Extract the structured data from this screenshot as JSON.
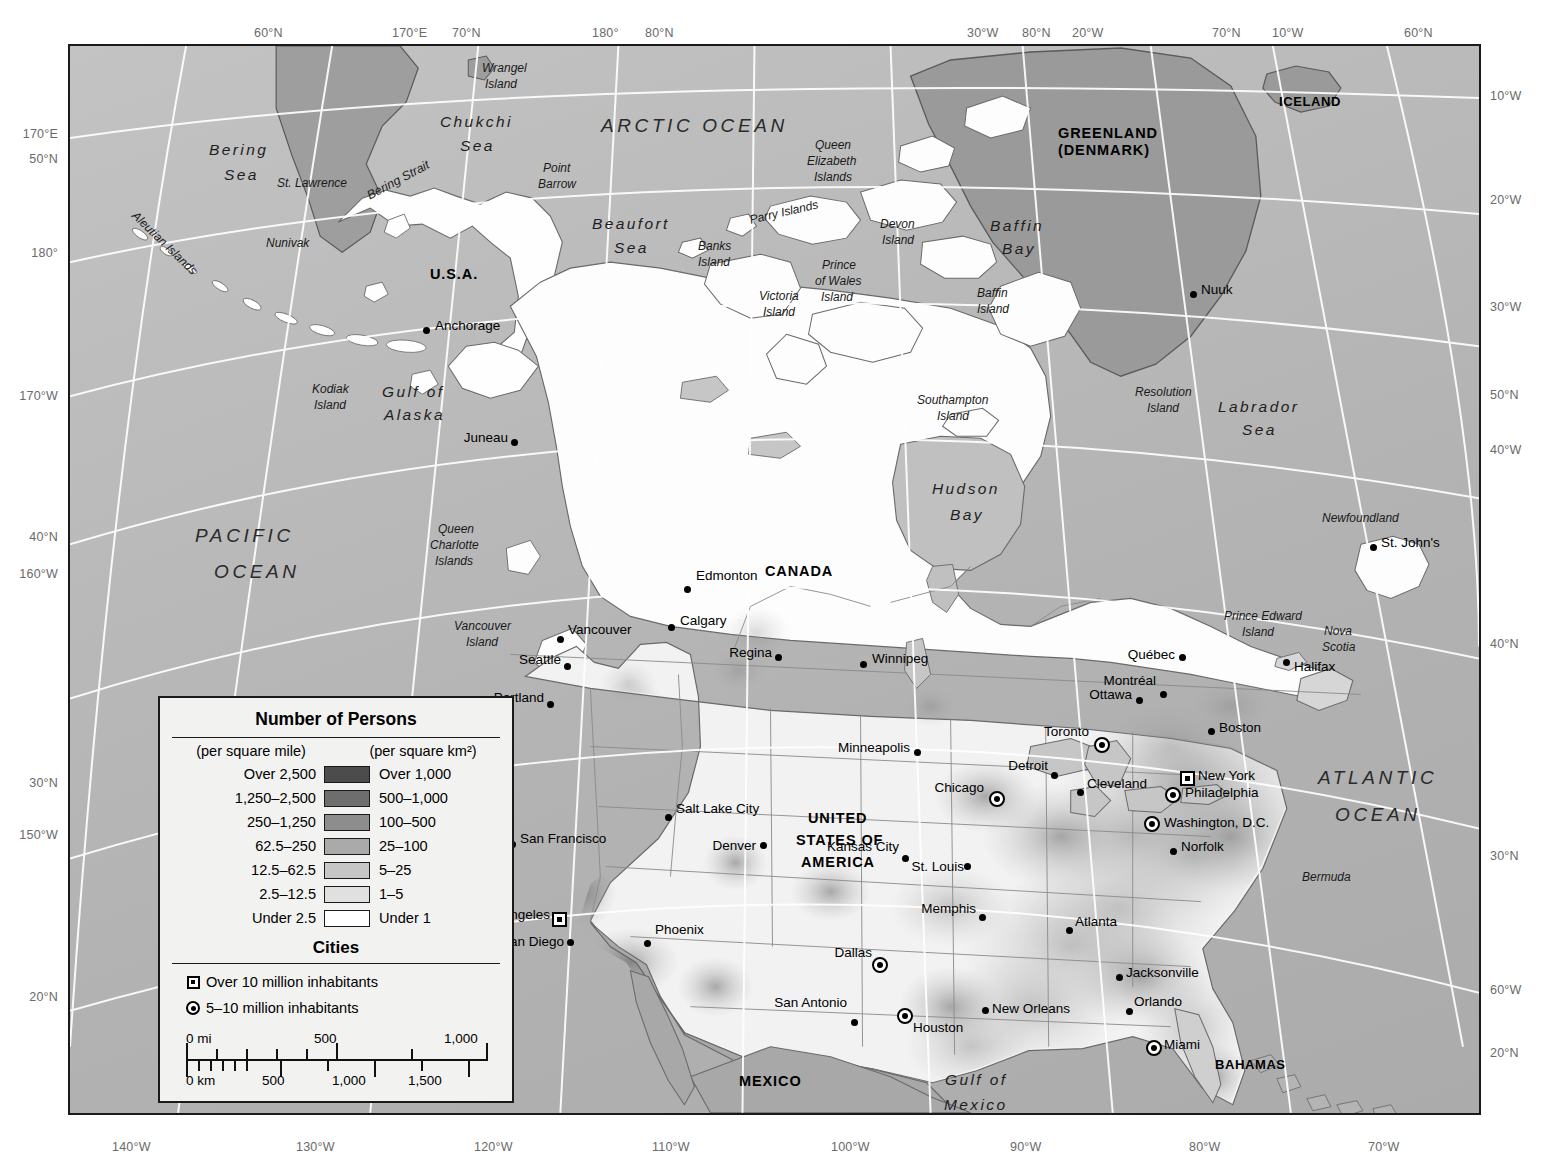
{
  "map": {
    "title": "Population Density of North America",
    "ocean_color": "#bcbcbc",
    "frame_color": "#1a1a1a",
    "graticule_color": "#ffffff"
  },
  "edge_labels": {
    "top": [
      {
        "text": "60°N",
        "x": 254
      },
      {
        "text": "170°E",
        "x": 392
      },
      {
        "text": "70°N",
        "x": 452
      },
      {
        "text": "180°",
        "x": 592
      },
      {
        "text": "80°N",
        "x": 645
      },
      {
        "text": "30°W",
        "x": 967
      },
      {
        "text": "80°N",
        "x": 1022
      },
      {
        "text": "20°W",
        "x": 1072
      },
      {
        "text": "70°N",
        "x": 1212
      },
      {
        "text": "10°W",
        "x": 1272
      },
      {
        "text": "60°N",
        "x": 1404
      }
    ],
    "left": [
      {
        "text": "170°E",
        "y": 127
      },
      {
        "text": "50°N",
        "y": 152
      },
      {
        "text": "180°",
        "y": 246
      },
      {
        "text": "170°W",
        "y": 389
      },
      {
        "text": "40°N",
        "y": 530
      },
      {
        "text": "160°W",
        "y": 567
      },
      {
        "text": "30°N",
        "y": 776
      },
      {
        "text": "150°W",
        "y": 828
      },
      {
        "text": "20°N",
        "y": 990
      }
    ],
    "right": [
      {
        "text": "10°W",
        "y": 89
      },
      {
        "text": "20°W",
        "y": 193
      },
      {
        "text": "30°W",
        "y": 300
      },
      {
        "text": "50°N",
        "y": 388
      },
      {
        "text": "40°W",
        "y": 443
      },
      {
        "text": "40°N",
        "y": 637
      },
      {
        "text": "30°N",
        "y": 849
      },
      {
        "text": "60°W",
        "y": 983
      },
      {
        "text": "20°N",
        "y": 1046
      }
    ],
    "bottom": [
      {
        "text": "140°W",
        "x": 112
      },
      {
        "text": "130°W",
        "x": 296
      },
      {
        "text": "120°W",
        "x": 474
      },
      {
        "text": "110°W",
        "x": 652
      },
      {
        "text": "100°W",
        "x": 831
      },
      {
        "text": "90°W",
        "x": 1010
      },
      {
        "text": "80°W",
        "x": 1189
      },
      {
        "text": "70°W",
        "x": 1368
      }
    ]
  },
  "legend": {
    "title": "Number of Persons",
    "head_left": "(per square mile)",
    "head_right": "(per square km²)",
    "rows": [
      {
        "mile": "Over 2,500",
        "km": "Over 1,000",
        "color": "#4c4c4c"
      },
      {
        "mile": "1,250–2,500",
        "km": "500–1,000",
        "color": "#6e6e6e"
      },
      {
        "mile": "250–1,250",
        "km": "100–500",
        "color": "#8d8d8d"
      },
      {
        "mile": "62.5–250",
        "km": "25–100",
        "color": "#aaaaaa"
      },
      {
        "mile": "12.5–62.5",
        "km": "5–25",
        "color": "#c6c6c6"
      },
      {
        "mile": "2.5–12.5",
        "km": "1–5",
        "color": "#e0e0e0"
      },
      {
        "mile": "Under 2.5",
        "km": "Under 1",
        "color": "#ffffff"
      }
    ],
    "cities_title": "Cities",
    "city_classes": [
      {
        "symbol": "square-in-square",
        "label": "Over 10 million inhabitants"
      },
      {
        "symbol": "circle-in-circle",
        "label": "5–10 million inhabitants"
      }
    ],
    "scale": {
      "miles_unit": "0 mi",
      "miles_mid": "500",
      "miles_end": "1,000",
      "km_unit": "0 km",
      "km_ticks": [
        "500",
        "1,000",
        "1,500"
      ]
    }
  },
  "countries": [
    {
      "name": "RUSSIA",
      "x": 291,
      "y": 32,
      "cls": "country"
    },
    {
      "name": "U.S.A.",
      "x": 428,
      "y": 265,
      "cls": "country"
    },
    {
      "name": "CANADA",
      "x": 763,
      "y": 562,
      "cls": "country"
    },
    {
      "name": "GREENLAND",
      "x": 1056,
      "y": 124,
      "cls": "country"
    },
    {
      "name": "(DENMARK)",
      "x": 1056,
      "y": 141,
      "cls": "country"
    },
    {
      "name": "ICELAND",
      "x": 1277,
      "y": 93,
      "cls": "country small"
    },
    {
      "name": "UNITED",
      "x": 806,
      "y": 809,
      "cls": "country"
    },
    {
      "name": "STATES OF",
      "x": 794,
      "y": 831,
      "cls": "country"
    },
    {
      "name": "AMERICA",
      "x": 799,
      "y": 853,
      "cls": "country"
    },
    {
      "name": "MEXICO",
      "x": 737,
      "y": 1072,
      "cls": "country"
    },
    {
      "name": "BAHAMAS",
      "x": 1213,
      "y": 1056,
      "cls": "country small"
    },
    {
      "name": "CUBA",
      "x": 1167,
      "y": 1112,
      "cls": "country small"
    }
  ],
  "oceans": [
    {
      "name": "ARCTIC OCEAN",
      "x": 599,
      "y": 114,
      "cls": "ocean"
    },
    {
      "name": "PACIFIC",
      "x": 193,
      "y": 524,
      "cls": "ocean"
    },
    {
      "name": "OCEAN",
      "x": 212,
      "y": 560,
      "cls": "ocean"
    },
    {
      "name": "ATLANTIC",
      "x": 1316,
      "y": 766,
      "cls": "ocean"
    },
    {
      "name": "OCEAN",
      "x": 1333,
      "y": 803,
      "cls": "ocean"
    }
  ],
  "seas": [
    {
      "name": "Bering",
      "x": 207,
      "y": 140,
      "cls": "sea"
    },
    {
      "name": "Sea",
      "x": 222,
      "y": 165,
      "cls": "sea"
    },
    {
      "name": "Chukchi",
      "x": 438,
      "y": 112,
      "cls": "sea"
    },
    {
      "name": "Sea",
      "x": 458,
      "y": 136,
      "cls": "sea"
    },
    {
      "name": "Beaufort",
      "x": 590,
      "y": 214,
      "cls": "sea"
    },
    {
      "name": "Sea",
      "x": 612,
      "y": 238,
      "cls": "sea"
    },
    {
      "name": "Baffin",
      "x": 988,
      "y": 216,
      "cls": "sea"
    },
    {
      "name": "Bay",
      "x": 1000,
      "y": 239,
      "cls": "sea"
    },
    {
      "name": "Labrador",
      "x": 1216,
      "y": 397,
      "cls": "sea"
    },
    {
      "name": "Sea",
      "x": 1240,
      "y": 420,
      "cls": "sea"
    },
    {
      "name": "Hudson",
      "x": 930,
      "y": 479,
      "cls": "sea"
    },
    {
      "name": "Bay",
      "x": 948,
      "y": 505,
      "cls": "sea"
    }
  ],
  "water_features": [
    {
      "name": "Bering Strait",
      "x": 362,
      "y": 172,
      "cls": "water",
      "rot": -28
    },
    {
      "name": "Gulf of",
      "x": 380,
      "y": 382,
      "cls": "sea"
    },
    {
      "name": "Alaska",
      "x": 382,
      "y": 405,
      "cls": "sea"
    },
    {
      "name": "Gulf of",
      "x": 943,
      "y": 1070,
      "cls": "sea"
    },
    {
      "name": "Mexico",
      "x": 942,
      "y": 1095,
      "cls": "sea"
    }
  ],
  "islands": [
    {
      "name": "Wrangel",
      "x": 480,
      "y": 60
    },
    {
      "name": "Island",
      "x": 483,
      "y": 76
    },
    {
      "name": "St. Lawrence",
      "x": 275,
      "y": 175
    },
    {
      "name": "Nunivak",
      "x": 264,
      "y": 235
    },
    {
      "name": "Aleutian Islands",
      "x": 120,
      "y": 235,
      "rot": 44
    },
    {
      "name": "Kodiak",
      "x": 310,
      "y": 381
    },
    {
      "name": "Island",
      "x": 312,
      "y": 397
    },
    {
      "name": "Point",
      "x": 541,
      "y": 160
    },
    {
      "name": "Barrow",
      "x": 536,
      "y": 176
    },
    {
      "name": "Queen",
      "x": 813,
      "y": 137
    },
    {
      "name": "Elizabeth",
      "x": 805,
      "y": 153
    },
    {
      "name": "Islands",
      "x": 812,
      "y": 169
    },
    {
      "name": "Parry Islands",
      "x": 747,
      "y": 204,
      "rot": -13
    },
    {
      "name": "Devon",
      "x": 878,
      "y": 216
    },
    {
      "name": "Island",
      "x": 880,
      "y": 232
    },
    {
      "name": "Banks",
      "x": 696,
      "y": 238
    },
    {
      "name": "Island",
      "x": 696,
      "y": 254
    },
    {
      "name": "Prince",
      "x": 820,
      "y": 257
    },
    {
      "name": "of Wales",
      "x": 813,
      "y": 273
    },
    {
      "name": "Island",
      "x": 819,
      "y": 289
    },
    {
      "name": "Victoria",
      "x": 757,
      "y": 288
    },
    {
      "name": "Island",
      "x": 761,
      "y": 304
    },
    {
      "name": "Baffin",
      "x": 975,
      "y": 285
    },
    {
      "name": "Island",
      "x": 975,
      "y": 301
    },
    {
      "name": "Southampton",
      "x": 915,
      "y": 392
    },
    {
      "name": "Island",
      "x": 935,
      "y": 408
    },
    {
      "name": "Resolution",
      "x": 1133,
      "y": 384
    },
    {
      "name": "Island",
      "x": 1145,
      "y": 400
    },
    {
      "name": "Queen",
      "x": 436,
      "y": 521
    },
    {
      "name": "Charlotte",
      "x": 428,
      "y": 537
    },
    {
      "name": "Islands",
      "x": 433,
      "y": 553
    },
    {
      "name": "Vancouver",
      "x": 452,
      "y": 618
    },
    {
      "name": "Island",
      "x": 464,
      "y": 634
    },
    {
      "name": "Newfoundland",
      "x": 1320,
      "y": 510
    },
    {
      "name": "Prince Edward",
      "x": 1222,
      "y": 608
    },
    {
      "name": "Island",
      "x": 1240,
      "y": 624
    },
    {
      "name": "Nova",
      "x": 1322,
      "y": 623
    },
    {
      "name": "Scotia",
      "x": 1320,
      "y": 639
    },
    {
      "name": "Bermuda",
      "x": 1300,
      "y": 869
    }
  ],
  "cities": [
    {
      "name": "Anchorage",
      "x": 424,
      "y": 328,
      "sym": "dot",
      "lx": 433,
      "ly": 325,
      "anchor": "left"
    },
    {
      "name": "Juneau",
      "x": 512,
      "y": 440,
      "sym": "dot",
      "lx": 506,
      "ly": 437,
      "anchor": "right"
    },
    {
      "name": "Nuuk",
      "x": 1191,
      "y": 292,
      "sym": "dot",
      "lx": 1199,
      "ly": 289,
      "anchor": "left"
    },
    {
      "name": "Edmonton",
      "x": 685,
      "y": 587,
      "sym": "dot",
      "lx": 694,
      "ly": 575,
      "anchor": "left"
    },
    {
      "name": "Calgary",
      "x": 669,
      "y": 625,
      "sym": "dot",
      "lx": 678,
      "ly": 620,
      "anchor": "left"
    },
    {
      "name": "Regina",
      "x": 776,
      "y": 655,
      "sym": "dot",
      "lx": 770,
      "ly": 652,
      "anchor": "right"
    },
    {
      "name": "Winnipeg",
      "x": 861,
      "y": 662,
      "sym": "dot",
      "lx": 870,
      "ly": 658,
      "anchor": "left"
    },
    {
      "name": "Vancouver",
      "x": 558,
      "y": 637,
      "sym": "dot",
      "lx": 566,
      "ly": 629,
      "anchor": "left"
    },
    {
      "name": "Seattle",
      "x": 565,
      "y": 664,
      "sym": "dot",
      "lx": 559,
      "ly": 659,
      "anchor": "right"
    },
    {
      "name": "Portland",
      "x": 548,
      "y": 702,
      "sym": "dot",
      "lx": 542,
      "ly": 697,
      "anchor": "right"
    },
    {
      "name": "San Francisco",
      "x": 510,
      "y": 842,
      "sym": "dot",
      "lx": 518,
      "ly": 838,
      "anchor": "left"
    },
    {
      "name": "Los Angeles",
      "x": 557,
      "y": 917,
      "sym": "mega",
      "lx": 548,
      "ly": 914,
      "anchor": "right"
    },
    {
      "name": "San Diego",
      "x": 568,
      "y": 940,
      "sym": "dot",
      "lx": 562,
      "ly": 941,
      "anchor": "right"
    },
    {
      "name": "Salt Lake City",
      "x": 666,
      "y": 815,
      "sym": "dot",
      "lx": 674,
      "ly": 808,
      "anchor": "left"
    },
    {
      "name": "Denver",
      "x": 761,
      "y": 843,
      "sym": "dot",
      "lx": 754,
      "ly": 845,
      "anchor": "right"
    },
    {
      "name": "Phoenix",
      "x": 645,
      "y": 941,
      "sym": "dot",
      "lx": 653,
      "ly": 929,
      "anchor": "left"
    },
    {
      "name": "Minneapolis",
      "x": 915,
      "y": 750,
      "sym": "dot",
      "lx": 908,
      "ly": 747,
      "anchor": "right"
    },
    {
      "name": "Chicago",
      "x": 995,
      "y": 797,
      "sym": "large",
      "lx": 982,
      "ly": 787,
      "anchor": "right"
    },
    {
      "name": "Detroit",
      "x": 1052,
      "y": 773,
      "sym": "dot",
      "lx": 1046,
      "ly": 765,
      "anchor": "right"
    },
    {
      "name": "Cleveland",
      "x": 1078,
      "y": 790,
      "sym": "dot",
      "lx": 1085,
      "ly": 783,
      "anchor": "left"
    },
    {
      "name": "Toronto",
      "x": 1100,
      "y": 743,
      "sym": "large",
      "lx": 1087,
      "ly": 731,
      "anchor": "right"
    },
    {
      "name": "Québec",
      "x": 1180,
      "y": 655,
      "sym": "dot",
      "lx": 1173,
      "ly": 654,
      "anchor": "right"
    },
    {
      "name": "Montréal",
      "x": 1161,
      "y": 692,
      "sym": "dot",
      "lx": 1154,
      "ly": 680,
      "anchor": "right"
    },
    {
      "name": "Ottawa",
      "x": 1137,
      "y": 698,
      "sym": "dot",
      "lx": 1130,
      "ly": 694,
      "anchor": "right"
    },
    {
      "name": "Halifax",
      "x": 1284,
      "y": 660,
      "sym": "dot",
      "lx": 1292,
      "ly": 666,
      "anchor": "left"
    },
    {
      "name": "St. John's",
      "x": 1371,
      "y": 545,
      "sym": "dot",
      "lx": 1379,
      "ly": 542,
      "anchor": "left"
    },
    {
      "name": "Boston",
      "x": 1209,
      "y": 729,
      "sym": "dot",
      "lx": 1217,
      "ly": 727,
      "anchor": "left"
    },
    {
      "name": "New York",
      "x": 1185,
      "y": 776,
      "sym": "mega",
      "lx": 1196,
      "ly": 775,
      "anchor": "left"
    },
    {
      "name": "Philadelphia",
      "x": 1171,
      "y": 793,
      "sym": "large",
      "lx": 1183,
      "ly": 792,
      "anchor": "left"
    },
    {
      "name": "Washington, D.C.",
      "x": 1150,
      "y": 822,
      "sym": "large",
      "lx": 1162,
      "ly": 822,
      "anchor": "left"
    },
    {
      "name": "Norfolk",
      "x": 1171,
      "y": 849,
      "sym": "dot",
      "lx": 1179,
      "ly": 846,
      "anchor": "left"
    },
    {
      "name": "Kansas City",
      "x": 903,
      "y": 856,
      "sym": "dot",
      "lx": 897,
      "ly": 846,
      "anchor": "right"
    },
    {
      "name": "St. Louis",
      "x": 965,
      "y": 864,
      "sym": "dot",
      "lx": 962,
      "ly": 866,
      "anchor": "right"
    },
    {
      "name": "Memphis",
      "x": 980,
      "y": 915,
      "sym": "dot",
      "lx": 974,
      "ly": 908,
      "anchor": "right"
    },
    {
      "name": "Atlanta",
      "x": 1067,
      "y": 928,
      "sym": "dot",
      "lx": 1073,
      "ly": 921,
      "anchor": "left"
    },
    {
      "name": "Dallas",
      "x": 878,
      "y": 963,
      "sym": "large",
      "lx": 870,
      "ly": 952,
      "anchor": "right"
    },
    {
      "name": "San Antonio",
      "x": 852,
      "y": 1020,
      "sym": "dot",
      "lx": 845,
      "ly": 1002,
      "anchor": "right"
    },
    {
      "name": "Houston",
      "x": 903,
      "y": 1014,
      "sym": "large",
      "lx": 911,
      "ly": 1027,
      "anchor": "left"
    },
    {
      "name": "New Orleans",
      "x": 983,
      "y": 1008,
      "sym": "dot",
      "lx": 990,
      "ly": 1008,
      "anchor": "left"
    },
    {
      "name": "Jacksonville",
      "x": 1117,
      "y": 975,
      "sym": "dot",
      "lx": 1124,
      "ly": 972,
      "anchor": "left"
    },
    {
      "name": "Orlando",
      "x": 1127,
      "y": 1009,
      "sym": "dot",
      "lx": 1132,
      "ly": 1001,
      "anchor": "left"
    },
    {
      "name": "Miami",
      "x": 1152,
      "y": 1046,
      "sym": "large",
      "lx": 1162,
      "ly": 1044,
      "anchor": "left"
    }
  ]
}
